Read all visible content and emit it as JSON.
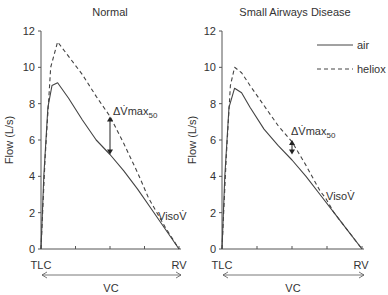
{
  "chart_data": [
    {
      "type": "line",
      "title": "Normal",
      "xlabel": "VC",
      "ylabel": "Flow (L/s)",
      "x_tick_labels": {
        "start": "TLC",
        "end": "RV"
      },
      "ylim": [
        0,
        12
      ],
      "yticks": [
        0,
        2,
        4,
        6,
        8,
        10,
        12
      ],
      "x_range_fraction": [
        0,
        1
      ],
      "grid": false,
      "series": [
        {
          "name": "air",
          "style": "solid",
          "points": [
            [
              0,
              0
            ],
            [
              0.02,
              4
            ],
            [
              0.05,
              7.8
            ],
            [
              0.08,
              9
            ],
            [
              0.12,
              9.15
            ],
            [
              0.2,
              8.3
            ],
            [
              0.3,
              7.1
            ],
            [
              0.4,
              6.0
            ],
            [
              0.5,
              5.2
            ],
            [
              0.6,
              4.3
            ],
            [
              0.7,
              3.3
            ],
            [
              0.8,
              2.2
            ],
            [
              0.9,
              1.1
            ],
            [
              1.0,
              0
            ]
          ]
        },
        {
          "name": "heliox",
          "style": "dashed",
          "points": [
            [
              0,
              0
            ],
            [
              0.03,
              5
            ],
            [
              0.07,
              10
            ],
            [
              0.12,
              11.4
            ],
            [
              0.2,
              10.6
            ],
            [
              0.3,
              9.6
            ],
            [
              0.4,
              8.4
            ],
            [
              0.5,
              7.3
            ],
            [
              0.6,
              5.8
            ],
            [
              0.7,
              4.2
            ],
            [
              0.78,
              2.8
            ],
            [
              0.84,
              2.0
            ],
            [
              0.9,
              1.2
            ],
            [
              1.0,
              0
            ]
          ]
        }
      ],
      "annotations": [
        {
          "text": "ΔV̇max",
          "subscript": "50",
          "x": 0.5,
          "y_from": 7.3,
          "y_to": 5.2
        },
        {
          "text": "VisoV̇",
          "x": 0.84,
          "y": 2.0
        }
      ]
    },
    {
      "type": "line",
      "title": "Small Airways Disease",
      "xlabel": "VC",
      "ylabel": "Flow (L/s)",
      "x_tick_labels": {
        "start": "TLC",
        "end": "RV"
      },
      "ylim": [
        0,
        12
      ],
      "yticks": [
        0,
        2,
        4,
        6,
        8,
        10,
        12
      ],
      "grid": false,
      "legend": {
        "position": "upper right",
        "entries": [
          {
            "label": "air",
            "style": "solid"
          },
          {
            "label": "heliox",
            "style": "dashed"
          }
        ]
      },
      "series": [
        {
          "name": "air",
          "style": "solid",
          "points": [
            [
              0,
              0
            ],
            [
              0.02,
              4
            ],
            [
              0.05,
              7.8
            ],
            [
              0.09,
              8.85
            ],
            [
              0.14,
              8.6
            ],
            [
              0.2,
              7.8
            ],
            [
              0.3,
              6.6
            ],
            [
              0.4,
              5.7
            ],
            [
              0.5,
              4.9
            ],
            [
              0.6,
              4.0
            ],
            [
              0.7,
              3.0
            ],
            [
              0.8,
              2.0
            ],
            [
              0.9,
              1.0
            ],
            [
              1.0,
              0
            ]
          ]
        },
        {
          "name": "heliox",
          "style": "dashed",
          "points": [
            [
              0,
              0
            ],
            [
              0.03,
              5
            ],
            [
              0.06,
              9
            ],
            [
              0.09,
              10.0
            ],
            [
              0.14,
              9.7
            ],
            [
              0.2,
              9.0
            ],
            [
              0.3,
              7.9
            ],
            [
              0.4,
              6.8
            ],
            [
              0.5,
              5.9
            ],
            [
              0.6,
              4.6
            ],
            [
              0.7,
              3.2
            ],
            [
              0.74,
              2.8
            ],
            [
              0.8,
              2.0
            ],
            [
              0.9,
              1.0
            ],
            [
              1.0,
              0
            ]
          ]
        }
      ],
      "annotations": [
        {
          "text": "ΔV̇max",
          "subscript": "50",
          "x": 0.5,
          "y_from": 6.0,
          "y_to": 5.2
        },
        {
          "text": "VisoV̇",
          "x": 0.74,
          "y": 2.8
        }
      ]
    }
  ],
  "panels": [
    {
      "title": "Normal",
      "ylabel": "Flow (L/s)",
      "xlabel": "VC",
      "tlc": "TLC",
      "rv": "RV",
      "delta_label": "ΔV̇max",
      "delta_sub": "50",
      "iso_label": "VisoV̇"
    },
    {
      "title": "Small Airways Disease",
      "ylabel": "Flow (L/s)",
      "xlabel": "VC",
      "tlc": "TLC",
      "rv": "RV",
      "delta_label": "ΔV̇max",
      "delta_sub": "50",
      "iso_label": "VisoV̇"
    }
  ],
  "legend": {
    "air": "air",
    "heliox": "heliox"
  },
  "colors": {
    "axis": "#555555",
    "line": "#444444",
    "text": "#333333"
  }
}
